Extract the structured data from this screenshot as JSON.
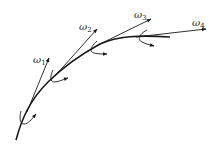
{
  "diagram": {
    "type": "kinematic chain angular velocity vectors",
    "stroke_color": "#1a1a1a",
    "background": "#ffffff",
    "labels": [
      {
        "symbol": "ω",
        "sub": "1"
      },
      {
        "symbol": "ω",
        "sub": "2"
      },
      {
        "symbol": "ω",
        "sub": "3"
      },
      {
        "symbol": "ω",
        "sub": "4"
      }
    ]
  }
}
